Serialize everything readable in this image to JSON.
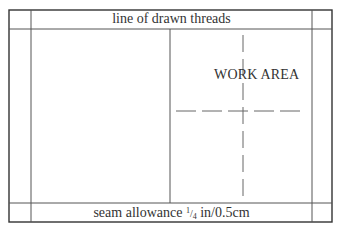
{
  "diagram": {
    "title_top": "line of drawn threads",
    "work_area_label": "WORK AREA",
    "bottom": {
      "prefix": "seam allowance ",
      "fraction_numerator": "1",
      "fraction_slash": "/",
      "fraction_denominator": "4",
      "suffix": " in/0.5cm"
    },
    "colors": {
      "outer_border": "#333333",
      "inner_lines": "#555555",
      "dashed_lines": "#666666",
      "text": "#333333",
      "background": "#ffffff"
    },
    "geometry": {
      "outer_rect": {
        "x": 9,
        "y": 10,
        "w": 323,
        "h": 212
      },
      "inner_left_x": 31,
      "inner_right_x": 312,
      "inner_top_y": 29,
      "inner_bottom_y": 203,
      "center_vertical_x": 170,
      "dashed_vertical_x": 243,
      "dashed_horizontal_y": 111
    }
  }
}
